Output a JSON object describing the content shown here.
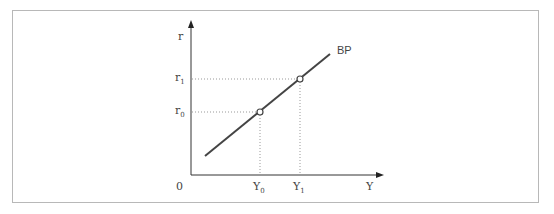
{
  "diagram": {
    "y_axis_label": "r",
    "x_axis_label": "Y",
    "origin_label": "0",
    "curve_label": "BP",
    "y_ticks": [
      {
        "base": "r",
        "sub": "1"
      },
      {
        "base": "r",
        "sub": "0"
      }
    ],
    "x_ticks": [
      {
        "base": "Y",
        "sub": "0"
      },
      {
        "base": "Y",
        "sub": "1"
      }
    ],
    "points": [
      {
        "name": "A",
        "x_label": "Y0",
        "y_label": "r0"
      },
      {
        "name": "B",
        "x_label": "Y1",
        "y_label": "r1"
      }
    ],
    "colors": {
      "line": "#444444",
      "axis": "#333333",
      "guide": "#999999",
      "frame": "#b8b8b8"
    }
  }
}
